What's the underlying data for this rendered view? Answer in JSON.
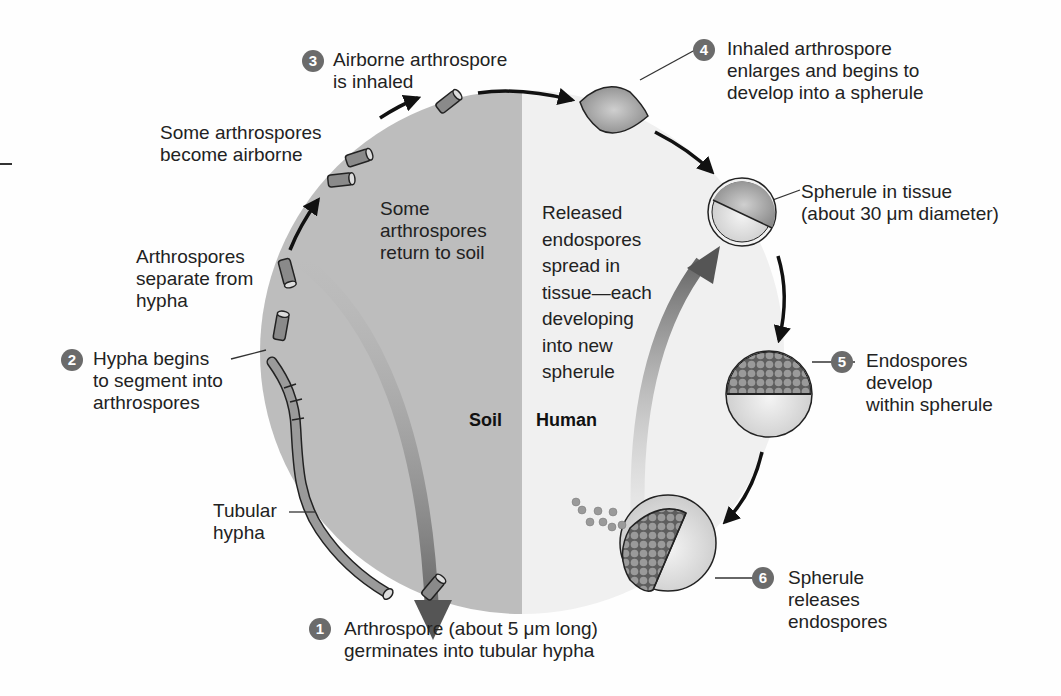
{
  "diagram": {
    "halves": {
      "left": {
        "label": "Soil",
        "color": "#bdbdbd"
      },
      "right": {
        "label": "Human",
        "color": "#f0f0f0"
      }
    },
    "steps": [
      {
        "number": "1",
        "lines": [
          "Arthrospore (about 5 μm long)",
          "germinates into tubular hypha"
        ]
      },
      {
        "number": "2",
        "lines": [
          "Hypha begins",
          "to segment into",
          "arthrospores"
        ]
      },
      {
        "number": "3",
        "lines": [
          "Airborne arthrospore",
          "is inhaled"
        ]
      },
      {
        "number": "4",
        "lines": [
          "Inhaled arthrospore",
          "enlarges and begins to",
          "develop into a spherule"
        ]
      },
      {
        "number": "5",
        "lines": [
          "Endospores",
          "develop",
          "within spherule"
        ]
      },
      {
        "number": "6",
        "lines": [
          "Spherule",
          "releases",
          "endospores"
        ]
      }
    ],
    "annotations": {
      "some_airborne": [
        "Some arthrospores",
        "become airborne"
      ],
      "separate": [
        "Arthrospores",
        "separate from",
        "hypha"
      ],
      "tubular_hypha": [
        "Tubular",
        "hypha"
      ],
      "spherule_tissue": [
        "Spherule in tissue",
        "(about 30 μm diameter)"
      ],
      "return_soil": [
        "Some",
        "arthrospores",
        "return to soil"
      ],
      "released_endospores": [
        "Released",
        "endospores",
        "spread in",
        "tissue—each",
        "developing",
        "into new",
        "spherule"
      ]
    },
    "colors": {
      "badge": "#6b6b6b",
      "arrow": "#111111",
      "big_arrow": "#6a6a6a",
      "spore_fill": "#8a8a8a"
    }
  }
}
